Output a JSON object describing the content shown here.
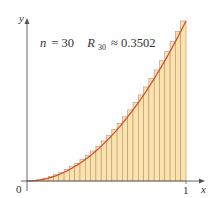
{
  "chart_data": {
    "type": "bar",
    "title": "",
    "annotation": {
      "n_label": "n",
      "n_equals": "= 30",
      "r_label": "R",
      "r_subscript": "30",
      "r_approx": "≈ 0.3502",
      "n": 30,
      "R_n": 0.3502
    },
    "function": "x^2",
    "method": "right-endpoint Riemann sum",
    "xlabel": "x",
    "ylabel": "y",
    "x_ticks": [
      {
        "value": 0,
        "label": "0"
      },
      {
        "value": 1,
        "label": "1"
      }
    ],
    "xlim": [
      0,
      1
    ],
    "ylim": [
      0,
      1
    ],
    "grid": false,
    "legend": null,
    "categories": [
      "0.0333",
      "0.0667",
      "0.1",
      "0.1333",
      "0.1667",
      "0.2",
      "0.2333",
      "0.2667",
      "0.3",
      "0.3333",
      "0.3667",
      "0.4",
      "0.4333",
      "0.4667",
      "0.5",
      "0.5333",
      "0.5667",
      "0.6",
      "0.6333",
      "0.6667",
      "0.7",
      "0.7333",
      "0.7667",
      "0.8",
      "0.8333",
      "0.8667",
      "0.9",
      "0.9333",
      "0.9667",
      "1.0"
    ],
    "values": [
      0.0011,
      0.0044,
      0.01,
      0.0178,
      0.0278,
      0.04,
      0.0544,
      0.0711,
      0.09,
      0.1111,
      0.1344,
      0.16,
      0.1878,
      0.2178,
      0.25,
      0.2844,
      0.3211,
      0.36,
      0.4011,
      0.4444,
      0.49,
      0.5378,
      0.5878,
      0.64,
      0.6944,
      0.7511,
      0.81,
      0.8711,
      0.9344,
      1.0
    ],
    "colors": {
      "bar_fill": "#FBE3B0",
      "bar_stroke": "#B8956A",
      "curve": "#D9482B",
      "axis": "#555555",
      "text": "#333333"
    }
  },
  "plot": {
    "origin_px": [
      27,
      181
    ],
    "x_one_px": 186,
    "y_one_px": 21,
    "x_axis_end_px": 205,
    "y_axis_end_px": 18
  }
}
